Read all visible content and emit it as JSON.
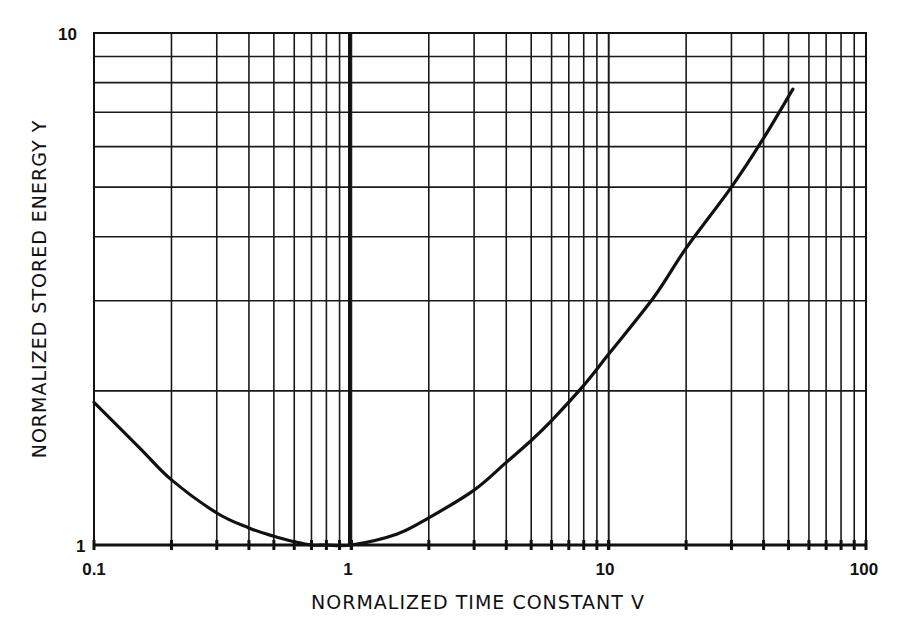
{
  "chart_data": {
    "type": "line",
    "title": "",
    "xlabel": "NORMALIZED TIME CONSTANT V",
    "ylabel": "NORMALIZED STORED ENERGY Y",
    "xscale": "log",
    "yscale": "log",
    "xlim": [
      0.1,
      100
    ],
    "ylim": [
      1,
      10
    ],
    "grid": true,
    "legend": null,
    "x_tick_labels": [
      "0.1",
      "1",
      "10",
      "100"
    ],
    "y_tick_labels": [
      "1",
      "10"
    ],
    "series": [
      {
        "name": "Y(V)",
        "x": [
          0.1,
          0.15,
          0.2,
          0.3,
          0.4,
          0.5,
          0.6,
          0.7,
          0.8,
          1.0,
          1.5,
          2,
          3,
          4,
          5,
          6,
          8,
          10,
          15,
          20,
          30,
          40,
          52
        ],
        "values": [
          1.9,
          1.55,
          1.34,
          1.155,
          1.08,
          1.04,
          1.015,
          1.0,
          1.0,
          1.0,
          1.05,
          1.13,
          1.28,
          1.45,
          1.6,
          1.75,
          2.05,
          2.36,
          3.05,
          3.8,
          5.0,
          6.23,
          7.77
        ]
      }
    ]
  },
  "labels": {
    "x_axis_title": "NORMALIZED TIME CONSTANT V",
    "y_axis_title": "NORMALIZED STORED ENERGY Y",
    "x_ticks": [
      "0.1",
      "1",
      "10",
      "100"
    ],
    "y_ticks": [
      "1",
      "10"
    ]
  }
}
